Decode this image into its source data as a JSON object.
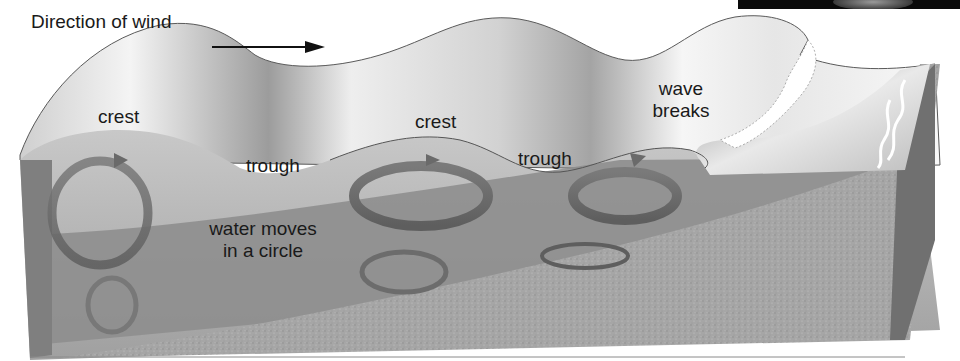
{
  "diagram": {
    "labels": {
      "wind_direction": "Direction of wind",
      "crest_1": "crest",
      "trough_1": "trough",
      "crest_2": "crest",
      "trough_2": "trough",
      "wave_breaks_line1": "wave",
      "wave_breaks_line2": "breaks",
      "water_moves_line1": "water moves",
      "water_moves_line2": "in a circle"
    },
    "icons": {
      "wind_arrow": "right-arrow",
      "orbit_arrows": "circular-arrow"
    },
    "colors": {
      "water_surface_light": "#f2f2f2",
      "water_surface_shadow": "#9e9e9e",
      "water_body": "#8f8f8f",
      "water_deep": "#7d7d7d",
      "sand": "#a8a8a8",
      "orbit_ring": "#6e6e6e",
      "text": "#1a1a1a",
      "photo_strip": "#0a0a0a"
    }
  }
}
